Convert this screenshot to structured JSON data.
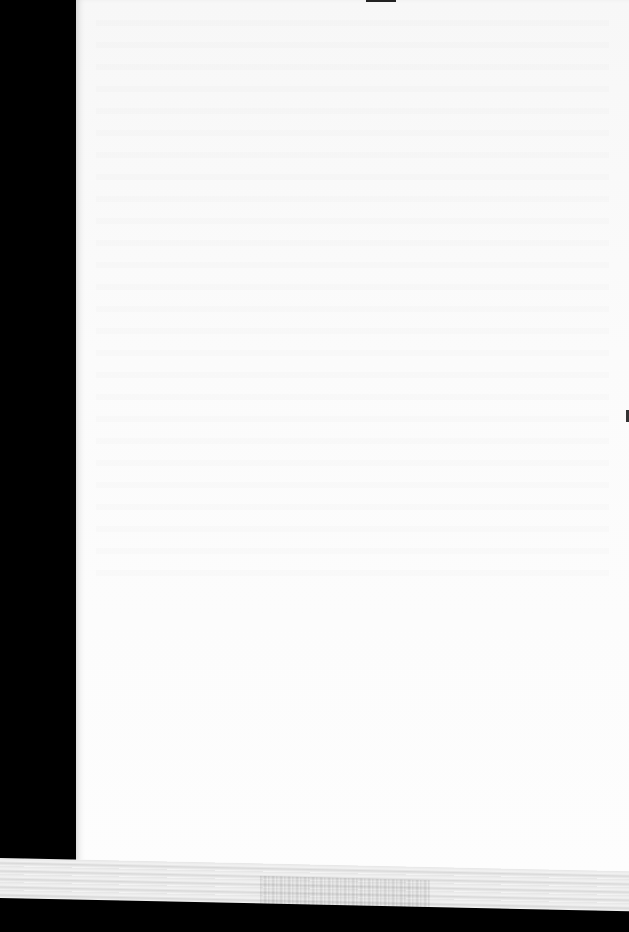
{
  "document": {
    "type": "scanned blank page",
    "text": "",
    "colors": {
      "margin": "#000000",
      "paper": "#fbfbfb",
      "strip": "#e6e6e6"
    }
  }
}
